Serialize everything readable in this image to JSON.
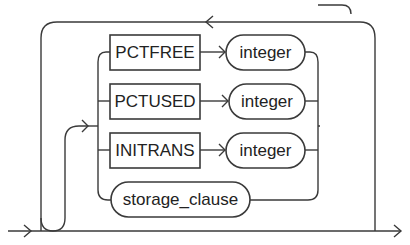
{
  "diagram": {
    "type": "railroad-syntax-diagram",
    "colors": {
      "stroke": "#3a3a3a",
      "text": "#222222",
      "background": "#ffffff"
    },
    "keywords": [
      {
        "label": "PCTFREE",
        "kind": "keyword"
      },
      {
        "label": "PCTUSED",
        "kind": "keyword"
      },
      {
        "label": "INITRANS",
        "kind": "keyword"
      }
    ],
    "nonterminals": [
      {
        "label": "integer",
        "kind": "nonterminal"
      },
      {
        "label": "integer",
        "kind": "nonterminal"
      },
      {
        "label": "integer",
        "kind": "nonterminal"
      },
      {
        "label": "storage_clause",
        "kind": "nonterminal"
      }
    ],
    "rows": [
      {
        "keyword": "PCTFREE",
        "argument": "integer"
      },
      {
        "keyword": "PCTUSED",
        "argument": "integer"
      },
      {
        "keyword": "INITRANS",
        "argument": "integer"
      },
      {
        "keyword": "",
        "argument": "storage_clause"
      }
    ],
    "structure": {
      "repeat_loop": true,
      "optional_skip": true,
      "choice_count": 4
    }
  }
}
